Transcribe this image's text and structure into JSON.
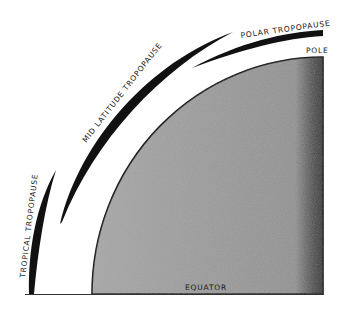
{
  "diagram": {
    "type": "atmospheric cross-section (quarter earth, equator to pole)",
    "labels": {
      "tropical": "TROPICAL TROPOPAUSE",
      "mid_latitude": "MID LATITUDE TROPOPAUSE",
      "polar": "POLAR TROPOPAUSE",
      "pole": "POLE",
      "equator": "EQUATOR"
    },
    "colors": {
      "earth_fill": "#9a9a9a",
      "earth_dark_edge": "#3a3a3a",
      "tropopause": "#111111",
      "background": "#ffffff"
    }
  }
}
